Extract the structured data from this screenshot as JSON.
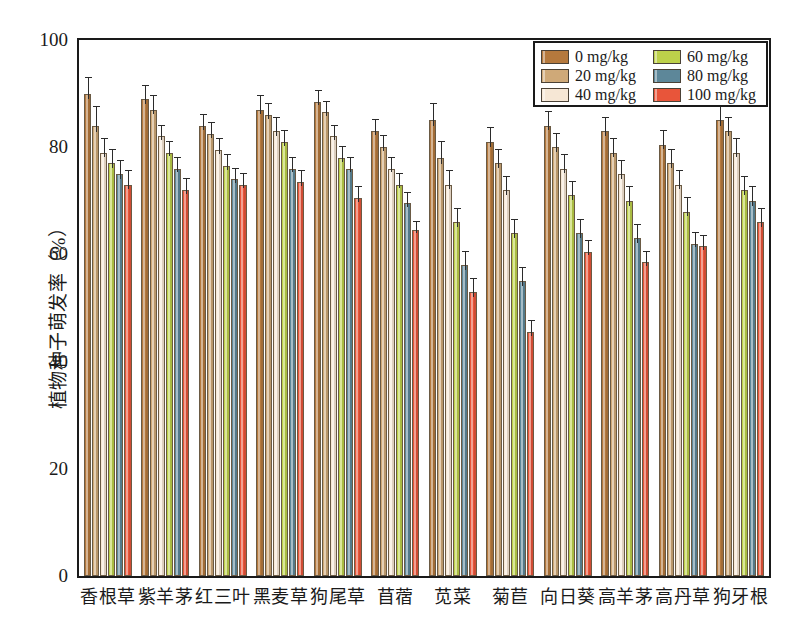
{
  "chart_data": {
    "type": "bar",
    "title": "",
    "xlabel": "",
    "ylabel": "植物种子萌发率（%）",
    "ylim": [
      0,
      100
    ],
    "ytick_values": [
      0,
      20,
      40,
      60,
      80,
      100
    ],
    "ytick_labels": [
      "0",
      "20",
      "40",
      "60",
      "80",
      "100"
    ],
    "yminor_values": [
      10,
      30,
      50,
      70,
      90
    ],
    "grid": false,
    "legend_position": "top-right",
    "categories": [
      "香根草",
      "紫羊茅",
      "红三叶",
      "黑麦草",
      "狗尾草",
      "苜蓿",
      "苋菜",
      "菊苣",
      "向日葵",
      "高羊茅",
      "高丹草",
      "狗牙根"
    ],
    "series": [
      {
        "name": "0 mg/kg",
        "color": "#b5793d",
        "values": [
          90.0,
          89.0,
          84.0,
          87.0,
          88.5,
          83.0,
          85.0,
          81.0,
          84.0,
          83.0,
          80.5,
          85.0
        ],
        "errors": [
          3.0,
          2.5,
          2.0,
          2.5,
          2.0,
          2.0,
          3.0,
          2.5,
          2.5,
          2.5,
          2.5,
          3.0
        ]
      },
      {
        "name": "20 mg/kg",
        "color": "#cfa978",
        "values": [
          84.0,
          87.0,
          82.5,
          86.0,
          86.5,
          80.0,
          78.0,
          77.0,
          80.0,
          79.0,
          77.0,
          83.0
        ],
        "errors": [
          3.5,
          2.5,
          2.0,
          2.0,
          2.0,
          2.0,
          3.0,
          2.5,
          2.5,
          2.5,
          2.5,
          2.5
        ]
      },
      {
        "name": "40 mg/kg",
        "color": "#f6e7d5",
        "values": [
          79.0,
          82.0,
          79.5,
          83.0,
          82.0,
          76.0,
          73.0,
          72.0,
          76.0,
          75.0,
          73.0,
          79.0
        ],
        "errors": [
          2.5,
          2.0,
          2.0,
          2.5,
          2.0,
          2.0,
          2.5,
          2.5,
          2.5,
          2.5,
          2.5,
          2.5
        ]
      },
      {
        "name": "60 mg/kg",
        "color": "#bdd14a",
        "values": [
          77.0,
          79.0,
          76.5,
          81.0,
          78.0,
          73.0,
          66.0,
          64.0,
          71.0,
          70.0,
          68.0,
          72.0
        ],
        "errors": [
          2.5,
          2.0,
          2.0,
          2.0,
          2.0,
          2.0,
          2.5,
          2.5,
          2.5,
          2.5,
          2.5,
          2.5
        ]
      },
      {
        "name": "80 mg/kg",
        "color": "#5d8799",
        "values": [
          75.0,
          76.0,
          74.0,
          76.0,
          76.0,
          69.5,
          58.0,
          55.0,
          64.0,
          63.0,
          62.0,
          70.0
        ],
        "errors": [
          2.5,
          2.0,
          2.0,
          2.0,
          2.0,
          2.0,
          2.5,
          2.5,
          2.5,
          2.5,
          2.0,
          2.5
        ]
      },
      {
        "name": "100 mg/kg",
        "color": "#e8553a",
        "values": [
          73.0,
          72.0,
          73.0,
          73.5,
          70.5,
          64.5,
          53.0,
          45.5,
          60.5,
          58.5,
          61.5,
          66.0
        ],
        "errors": [
          2.5,
          2.0,
          2.0,
          2.0,
          2.0,
          1.5,
          2.5,
          2.0,
          2.0,
          2.0,
          2.0,
          2.5
        ]
      }
    ]
  },
  "legend": {
    "items": [
      {
        "label": "0 mg/kg",
        "color": "#b5793d"
      },
      {
        "label": "20 mg/kg",
        "color": "#cfa978"
      },
      {
        "label": "40 mg/kg",
        "color": "#f6e7d5"
      },
      {
        "label": "60 mg/kg",
        "color": "#bdd14a"
      },
      {
        "label": "80 mg/kg",
        "color": "#5d8799"
      },
      {
        "label": "100 mg/kg",
        "color": "#e8553a"
      }
    ]
  },
  "axes": {
    "y_title": "植物种子萌发率（%）"
  }
}
